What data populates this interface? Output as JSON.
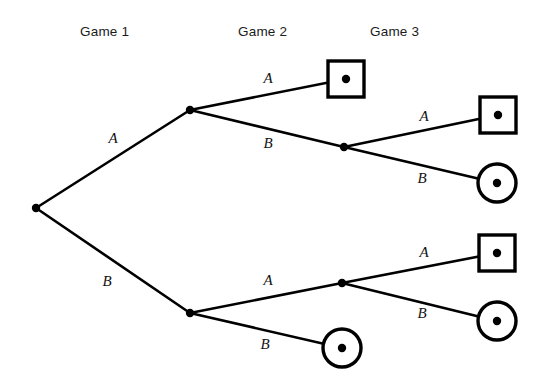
{
  "figure": {
    "kind": "extensive-form-game-tree",
    "background_color": "#ffffff",
    "line_color": "#000000",
    "width": 543,
    "height": 392
  },
  "stage_headers": [
    {
      "label": "Game 1",
      "x": 80,
      "y": 24
    },
    {
      "label": "Game 2",
      "x": 238,
      "y": 24
    },
    {
      "label": "Game 3",
      "x": 370,
      "y": 24
    }
  ],
  "nodes": [
    {
      "id": "root",
      "shape": "dot",
      "x": 36,
      "y": 208,
      "stage": "Game 1"
    },
    {
      "id": "g2-up",
      "shape": "dot",
      "x": 190,
      "y": 110,
      "stage": "Game 2"
    },
    {
      "id": "g2-down",
      "shape": "dot",
      "x": 190,
      "y": 313,
      "stage": "Game 2"
    },
    {
      "id": "g3-up",
      "shape": "dot",
      "x": 344,
      "y": 147,
      "stage": "Game 3"
    },
    {
      "id": "g3-down",
      "shape": "dot",
      "x": 342,
      "y": 283,
      "stage": "Game 3"
    },
    {
      "id": "t1",
      "shape": "square",
      "x": 346,
      "y": 79,
      "stage": "terminal"
    },
    {
      "id": "t2",
      "shape": "square",
      "x": 498,
      "y": 115,
      "stage": "terminal"
    },
    {
      "id": "t3",
      "shape": "circle",
      "x": 497,
      "y": 183,
      "stage": "terminal"
    },
    {
      "id": "t4",
      "shape": "square",
      "x": 497,
      "y": 253,
      "stage": "terminal"
    },
    {
      "id": "t5",
      "shape": "circle",
      "x": 497,
      "y": 321,
      "stage": "terminal"
    },
    {
      "id": "t6",
      "shape": "circle",
      "x": 342,
      "y": 348,
      "stage": "terminal"
    }
  ],
  "edges": [
    {
      "id": "e1",
      "from": "root",
      "to": "g2-up",
      "label": "A",
      "label_x": 113,
      "label_y": 138
    },
    {
      "id": "e2",
      "from": "root",
      "to": "g2-down",
      "label": "B",
      "label_x": 107,
      "label_y": 281
    },
    {
      "id": "e3",
      "from": "g2-up",
      "to": "t1",
      "label": "A",
      "label_x": 268,
      "label_y": 78
    },
    {
      "id": "e4",
      "from": "g2-up",
      "to": "g3-up",
      "label": "B",
      "label_x": 268,
      "label_y": 143
    },
    {
      "id": "e5",
      "from": "g3-up",
      "to": "t2",
      "label": "A",
      "label_x": 424,
      "label_y": 116
    },
    {
      "id": "e6",
      "from": "g3-up",
      "to": "t3",
      "label": "B",
      "label_x": 422,
      "label_y": 178
    },
    {
      "id": "e7",
      "from": "g2-down",
      "to": "g3-down",
      "label": "A",
      "label_x": 268,
      "label_y": 280
    },
    {
      "id": "e8",
      "from": "g2-down",
      "to": "t6",
      "label": "B",
      "label_x": 265,
      "label_y": 344
    },
    {
      "id": "e9",
      "from": "g3-down",
      "to": "t4",
      "label": "A",
      "label_x": 424,
      "label_y": 252
    },
    {
      "id": "e10",
      "from": "g3-down",
      "to": "t5",
      "label": "B",
      "label_x": 422,
      "label_y": 313
    }
  ],
  "geometry": {
    "square_size": 36,
    "circle_radius": 19,
    "dot_radius": 4.2,
    "edge_stroke_width": 2.6,
    "shape_stroke_width": 3.4
  }
}
